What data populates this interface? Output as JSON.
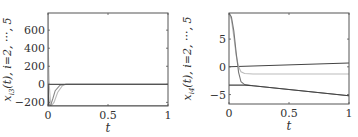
{
  "chart_data": [
    {
      "type": "line",
      "title": "",
      "xlabel": "t",
      "ylabel": "x_{i3}(t), i=2, ..., 5",
      "xlim": [
        0,
        1
      ],
      "ylim": [
        -240,
        790
      ],
      "xticks": [
        "0",
        "0.5",
        "1"
      ],
      "yticks": [
        "-200",
        "0",
        "200",
        "400",
        "600"
      ],
      "grid": false,
      "legend": null,
      "series": [
        {
          "name": "i=2",
          "color": "#bbbbbb",
          "x": [
            0,
            0.002,
            0.01,
            0.02,
            0.03,
            0.05,
            0.08,
            0.12,
            0.15,
            0.2,
            1
          ],
          "y": [
            790,
            400,
            0,
            -180,
            -235,
            -200,
            -90,
            -15,
            0,
            0,
            0
          ]
        },
        {
          "name": "i=3",
          "color": "#888888",
          "x": [
            0,
            0.003,
            0.01,
            0.02,
            0.04,
            0.06,
            0.1,
            0.15,
            1
          ],
          "y": [
            0,
            -120,
            -220,
            -240,
            -160,
            -70,
            -10,
            0,
            0
          ]
        },
        {
          "name": "i=4",
          "color": "#555555",
          "x": [
            0,
            0.01,
            0.03,
            0.06,
            0.1,
            1
          ],
          "y": [
            0,
            0,
            0,
            0,
            0,
            0
          ]
        },
        {
          "name": "i=5",
          "color": "#333333",
          "x": [
            0,
            0.004,
            0.01,
            0.02,
            1
          ],
          "y": [
            0,
            -240,
            -240,
            -240,
            -240
          ]
        }
      ]
    },
    {
      "type": "line",
      "title": "",
      "xlabel": "t",
      "ylabel": "x_{i4}(t), i=2, ..., 5",
      "xlim": [
        0,
        1
      ],
      "ylim": [
        -6.7,
        9.7
      ],
      "xticks": [
        "0",
        "0.5",
        "1"
      ],
      "yticks": [
        "-5",
        "0",
        "5"
      ],
      "grid": false,
      "legend": null,
      "series": [
        {
          "name": "i=2",
          "color": "#444444",
          "x": [
            0,
            1
          ],
          "y": [
            0,
            0.7
          ]
        },
        {
          "name": "i=3",
          "color": "#bbbbbb",
          "x": [
            0,
            0.02,
            0.04,
            0.06,
            0.08,
            0.1,
            0.13,
            0.2,
            1
          ],
          "y": [
            9.7,
            8.5,
            5.5,
            2.0,
            0.0,
            -0.9,
            -1.2,
            -1.3,
            -1.3
          ]
        },
        {
          "name": "i=4",
          "color": "#777777",
          "x": [
            0,
            0.02,
            0.04,
            0.06,
            0.08,
            0.1,
            0.13,
            0.2,
            1
          ],
          "y": [
            9.7,
            9.0,
            6.5,
            2.5,
            -1.0,
            -2.7,
            -3.2,
            -3.4,
            -5.2
          ]
        },
        {
          "name": "i=5",
          "color": "#444444",
          "x": [
            0,
            0.13,
            0.2,
            1
          ],
          "y": [
            -3.3,
            -3.3,
            -3.4,
            -5.2
          ]
        }
      ]
    }
  ]
}
